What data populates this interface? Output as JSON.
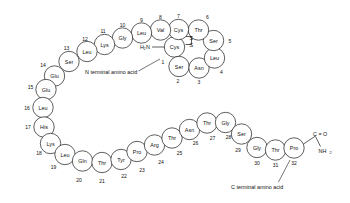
{
  "diagram": {
    "terminus_labels": {
      "n_terminal": "N   terminal amino acid",
      "c_terminal": "C   terminal amino acid",
      "n_terminal_group": "H",
      "n_terminal_group_sub": "2",
      "n_terminal_group_tail": "N",
      "c_terminal_carbonyl": "C = O",
      "c_terminal_amide": "NH",
      "c_terminal_amide_sub": "2"
    },
    "disulfide": {
      "label_s_top": "S",
      "label_s_bottom": "S",
      "from_residue": 7,
      "to_residue": 1,
      "color": "#1a1a1a"
    },
    "colors": {
      "stroke": "#1a1a1a",
      "fill": "#ffffff",
      "background": "#ffffff",
      "text": "#111111"
    },
    "residues": [
      {
        "n": "1",
        "aa": "Cys",
        "cx": 174.5,
        "cy": 47.0,
        "r": 10.2,
        "num_x": 163.0,
        "num_y": 62.0
      },
      {
        "n": "2",
        "aa": "Ser",
        "cx": 179.0,
        "cy": 66.5,
        "r": 10.2,
        "num_x": 178.0,
        "num_y": 80.5
      },
      {
        "n": "3",
        "aa": "Asn",
        "cx": 199.0,
        "cy": 68.0,
        "r": 10.2,
        "num_x": 199.0,
        "num_y": 82.0
      },
      {
        "n": "4",
        "aa": "Leu",
        "cx": 214.5,
        "cy": 58.0,
        "r": 10.2,
        "num_x": 221.5,
        "num_y": 71.5
      },
      {
        "n": "5",
        "aa": "Ser",
        "cx": 213.5,
        "cy": 40.5,
        "r": 10.2,
        "num_x": 230.0,
        "num_y": 40.5
      },
      {
        "n": "6",
        "aa": "Thr",
        "cx": 198.5,
        "cy": 30.0,
        "r": 10.2,
        "num_x": 207.5,
        "num_y": 17.0
      },
      {
        "n": "7",
        "aa": "Cys",
        "cx": 178.5,
        "cy": 29.5,
        "r": 10.2,
        "num_x": 178.5,
        "num_y": 15.5
      },
      {
        "n": "8",
        "aa": "Val",
        "cx": 160.5,
        "cy": 30.0,
        "r": 10.2,
        "num_x": 160.5,
        "num_y": 16.5
      },
      {
        "n": "9",
        "aa": "Leu",
        "cx": 141.5,
        "cy": 33.0,
        "r": 10.2,
        "num_x": 141.5,
        "num_y": 19.5
      },
      {
        "n": "10",
        "aa": "Gly",
        "cx": 122.5,
        "cy": 38.0,
        "r": 10.2,
        "num_x": 122.5,
        "num_y": 24.5
      },
      {
        "n": "11",
        "aa": "Lys",
        "cx": 104.5,
        "cy": 44.5,
        "r": 10.2,
        "num_x": 103.0,
        "num_y": 30.5
      },
      {
        "n": "12",
        "aa": "Leu",
        "cx": 87.0,
        "cy": 51.5,
        "r": 10.2,
        "num_x": 85.0,
        "num_y": 38.5
      },
      {
        "n": "13",
        "aa": "Ser",
        "cx": 69.0,
        "cy": 61.5,
        "r": 10.2,
        "num_x": 66.5,
        "num_y": 48.0
      },
      {
        "n": "14",
        "aa": "Glu",
        "cx": 54.5,
        "cy": 76.0,
        "r": 10.2,
        "num_x": 43.0,
        "num_y": 64.5
      },
      {
        "n": "15",
        "aa": "Glu",
        "cx": 46.0,
        "cy": 89.5,
        "r": 10.2,
        "num_x": 30.5,
        "num_y": 86.5
      },
      {
        "n": "16",
        "aa": "Leu",
        "cx": 43.0,
        "cy": 107.5,
        "r": 10.2,
        "num_x": 27.0,
        "num_y": 107.5
      },
      {
        "n": "17",
        "aa": "His",
        "cx": 44.0,
        "cy": 127.0,
        "r": 10.2,
        "num_x": 28.0,
        "num_y": 127.0
      },
      {
        "n": "18",
        "aa": "Lys",
        "cx": 50.5,
        "cy": 143.5,
        "r": 10.2,
        "num_x": 39.0,
        "num_y": 153.0
      },
      {
        "n": "19",
        "aa": "Leu",
        "cx": 65.0,
        "cy": 154.5,
        "r": 10.2,
        "num_x": 53.5,
        "num_y": 166.5
      },
      {
        "n": "20",
        "aa": "Gln",
        "cx": 82.5,
        "cy": 161.0,
        "r": 10.2,
        "num_x": 79.0,
        "num_y": 180.0
      },
      {
        "n": "21",
        "aa": "Thr",
        "cx": 102.0,
        "cy": 162.5,
        "r": 10.2,
        "num_x": 102.0,
        "num_y": 180.5
      },
      {
        "n": "22",
        "aa": "Tyr",
        "cx": 121.0,
        "cy": 159.5,
        "r": 10.2,
        "num_x": 124.0,
        "num_y": 176.0
      },
      {
        "n": "23",
        "aa": "Pro",
        "cx": 137.0,
        "cy": 151.5,
        "r": 10.2,
        "num_x": 142.0,
        "num_y": 169.5
      },
      {
        "n": "24",
        "aa": "Arg",
        "cx": 154.5,
        "cy": 145.0,
        "r": 10.2,
        "num_x": 161.0,
        "num_y": 161.5
      },
      {
        "n": "25",
        "aa": "Thr",
        "cx": 172.0,
        "cy": 138.0,
        "r": 10.2,
        "num_x": 179.5,
        "num_y": 152.5
      },
      {
        "n": "26",
        "aa": "Asn",
        "cx": 189.5,
        "cy": 129.5,
        "r": 10.2,
        "num_x": 195.5,
        "num_y": 143.0
      },
      {
        "n": "27",
        "aa": "Thr",
        "cx": 207.0,
        "cy": 123.0,
        "r": 10.2,
        "num_x": 212.5,
        "num_y": 138.0
      },
      {
        "n": "28",
        "aa": "Gly",
        "cx": 225.5,
        "cy": 122.5,
        "r": 10.2,
        "num_x": 228.5,
        "num_y": 137.0
      },
      {
        "n": "29",
        "aa": "Ser",
        "cx": 241.5,
        "cy": 134.0,
        "r": 10.2,
        "num_x": 238.0,
        "num_y": 150.0
      },
      {
        "n": "30",
        "aa": "Gly",
        "cx": 257.0,
        "cy": 147.5,
        "r": 10.2,
        "num_x": 257.0,
        "num_y": 162.5
      },
      {
        "n": "31",
        "aa": "Thr",
        "cx": 275.5,
        "cy": 150.0,
        "r": 10.2,
        "num_x": 275.5,
        "num_y": 165.0
      },
      {
        "n": "32",
        "aa": "Pro",
        "cx": 294.0,
        "cy": 148.0,
        "r": 10.2,
        "num_x": 294.0,
        "num_y": 163.0
      }
    ]
  }
}
